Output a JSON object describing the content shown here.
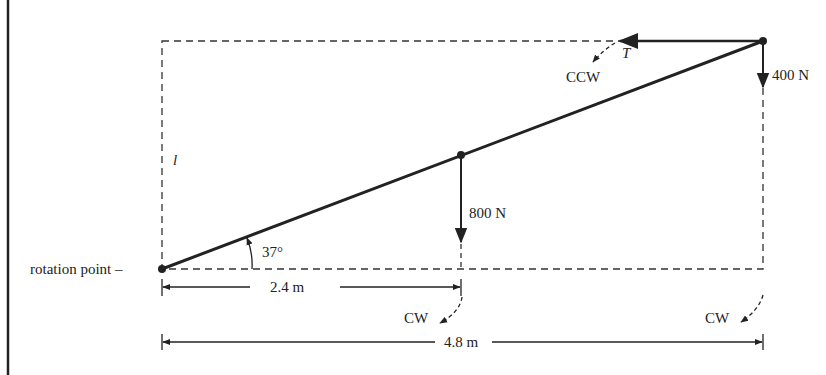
{
  "diagram": {
    "type": "free-body torque diagram",
    "labels": {
      "rotation_point": "rotation point –",
      "length_symbol": "l",
      "angle": "37°",
      "force_mid": "800  N",
      "force_end": "400  N",
      "tension": "T",
      "ccw": "CCW",
      "cw_mid": "CW",
      "cw_end": "CW",
      "dim_half": "2.4  m",
      "dim_full": "4.8 m"
    },
    "values": {
      "angle_deg": 37,
      "force_mid_N": 800,
      "force_end_N": 400,
      "half_length_m": 2.4,
      "full_length_m": 4.8
    },
    "colors": {
      "line": "#222222",
      "dashed": "#333333",
      "background": "#ffffff"
    }
  }
}
